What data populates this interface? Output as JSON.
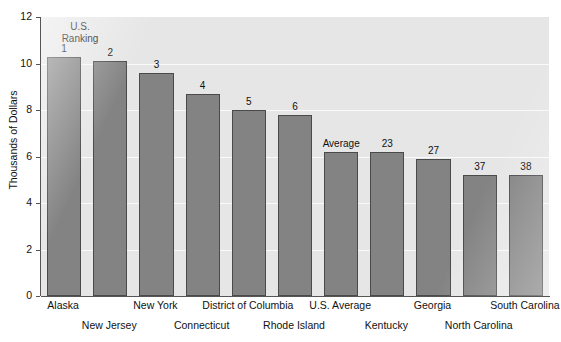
{
  "chart_data": {
    "type": "bar",
    "title": "",
    "xlabel": "",
    "ylabel": "Thousands of Dollars",
    "ylim": [
      0,
      12
    ],
    "ytick_labels": [
      "0",
      "2",
      "4",
      "6",
      "8",
      "10",
      "12"
    ],
    "ytick_values": [
      0,
      2,
      4,
      6,
      8,
      10,
      12
    ],
    "grid": true,
    "grid_values": [
      2,
      4,
      6,
      8,
      10
    ],
    "legend": "none",
    "annotation": "U.S. Ranking",
    "annotation_line1": "U.S.",
    "annotation_line2": "Ranking",
    "categories": [
      "Alaska",
      "New Jersey",
      "New York",
      "Connecticut",
      "District of Columbia",
      "Rhode Island",
      "U.S. Average",
      "Kentucky",
      "Georgia",
      "North Carolina",
      "South Carolina"
    ],
    "values": [
      10.3,
      10.1,
      9.6,
      8.7,
      8.0,
      7.8,
      6.2,
      6.2,
      5.9,
      5.2,
      5.2
    ],
    "data_labels": [
      "1",
      "2",
      "3",
      "4",
      "5",
      "6",
      "Average",
      "23",
      "27",
      "37",
      "38"
    ],
    "label_row": [
      0,
      1,
      0,
      1,
      0,
      1,
      0,
      1,
      0,
      1,
      0
    ],
    "bar_color": "#838383",
    "bar_edge_color": "#4a4a4a",
    "plot_background": "#e6e6e6",
    "grid_color": "#fafafa",
    "axis_color": "#555555",
    "text_color": "#111111"
  }
}
